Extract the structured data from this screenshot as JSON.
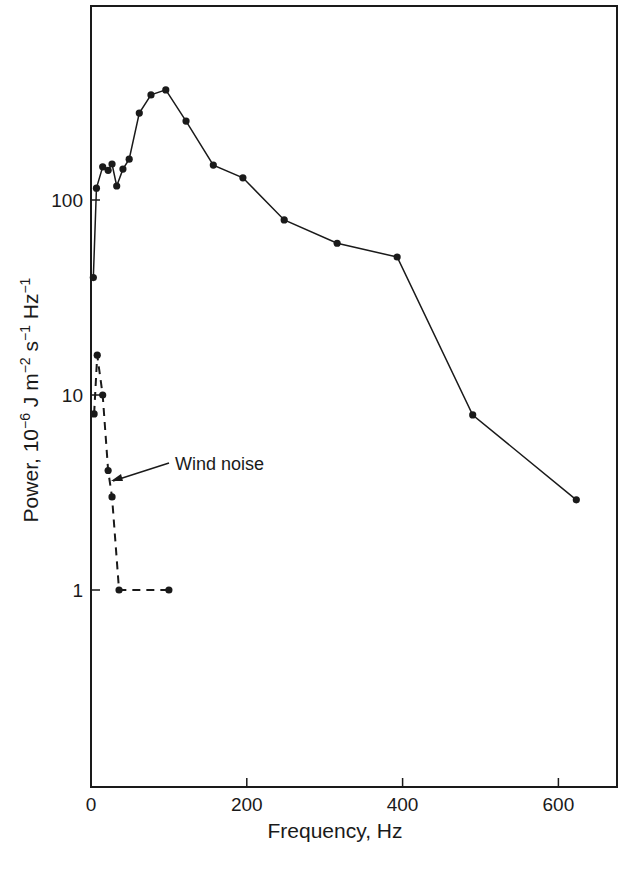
{
  "chart_data": {
    "type": "line",
    "title": "",
    "xlabel": "Frequency, Hz",
    "ylabel": "Power, 10^-6 J m^-2 s^-1 Hz^-1",
    "ylabel_parts": {
      "prefix": "Power, 10",
      "exp1": "−6",
      "unit1": " J m",
      "exp2": "−2",
      "unit2": " s",
      "exp3": "−1",
      "unit3": " Hz",
      "exp4": "−1"
    },
    "xlim": [
      0,
      675
    ],
    "ylim": [
      0.1,
      1000
    ],
    "yscale": "log",
    "grid": false,
    "legend": "none",
    "x_ticks": [
      0,
      200,
      400,
      600
    ],
    "x_tick_labels": [
      "0",
      "200",
      "400",
      "600"
    ],
    "y_ticks": [
      1,
      10,
      100
    ],
    "y_tick_labels": [
      "1",
      "10",
      "100"
    ],
    "series": [
      {
        "name": "Signal",
        "style": "solid",
        "x": [
          3,
          7,
          15,
          22,
          27,
          33,
          41,
          49,
          62,
          77,
          96,
          122,
          157,
          195,
          248,
          316,
          393,
          490,
          623
        ],
        "values": [
          40,
          115,
          148,
          142,
          153,
          118,
          144,
          162,
          279,
          346,
          367,
          254,
          151,
          130,
          79,
          60,
          51,
          7.9,
          2.9
        ]
      },
      {
        "name": "Wind noise",
        "style": "dashed",
        "x": [
          4,
          8,
          15,
          22,
          27,
          36,
          100
        ],
        "values": [
          8,
          16,
          10,
          4.1,
          3.0,
          1.0,
          1.0
        ]
      }
    ],
    "annotations": [
      {
        "text": "Wind noise",
        "points_to": {
          "x": 25,
          "y": 3.6
        }
      }
    ]
  },
  "colors": {
    "line": "#1a1a1a",
    "background": "#ffffff"
  }
}
